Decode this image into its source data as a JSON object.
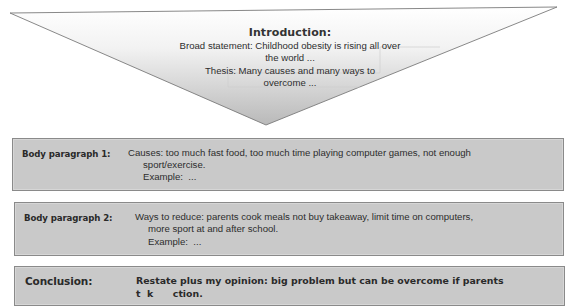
{
  "introduction": {
    "title": "Introduction:",
    "lines": [
      "Broad statement: Childhood obesity is rising all over",
      "the world  ...",
      "Thesis: Many causes and many ways to",
      "overcome  ..."
    ]
  },
  "body_paragraph_1": {
    "label": "Body paragraph 1:",
    "lines": [
      "Causes: too much fast food, too much time playing computer games, not enough",
      "sport/exercise.",
      "Example:  ..."
    ]
  },
  "body_paragraph_2": {
    "label": "Body paragraph 2:",
    "lines": [
      "Ways to reduce: parents cook meals not buy takeaway, limit time on computers,",
      "more sport at and after school.",
      "Example:  ..."
    ]
  },
  "conclusion": {
    "label": "Conclusion:",
    "lines": [
      "Restate plus my opinion: big problem but can be overcome if parents",
      "t  k      ction."
    ]
  },
  "colors": {
    "box_fill": "#c9c9c9",
    "box_border": "#8a8a8a",
    "triangle_fill_top": "#ffffff",
    "triangle_fill_bottom": "#bdbdbd",
    "triangle_stroke": "#7a7a7a"
  }
}
